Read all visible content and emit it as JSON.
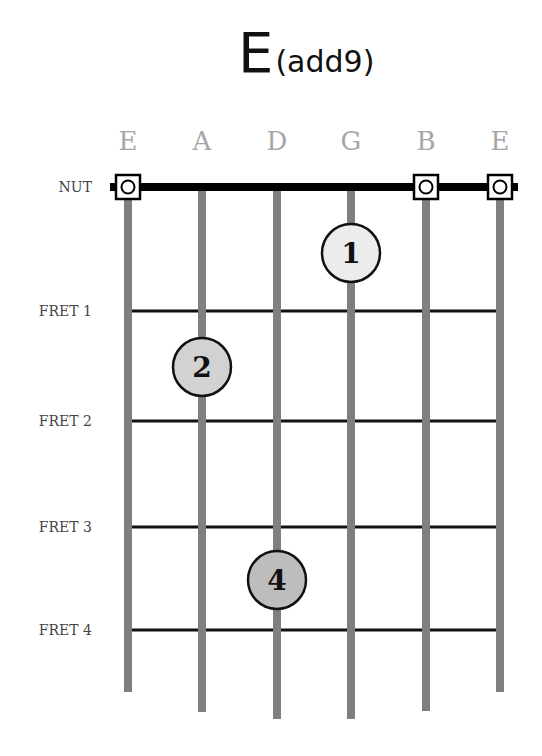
{
  "chord": {
    "name_main": "E",
    "name_suffix": "(add9)"
  },
  "strings": [
    {
      "name": "E",
      "x": 128,
      "bottom": 692
    },
    {
      "name": "A",
      "x": 202,
      "bottom": 712
    },
    {
      "name": "D",
      "x": 277,
      "bottom": 719
    },
    {
      "name": "G",
      "x": 351,
      "bottom": 719
    },
    {
      "name": "B",
      "x": 426,
      "bottom": 711
    },
    {
      "name": "E",
      "x": 500,
      "bottom": 692
    }
  ],
  "nut": {
    "label": "NUT",
    "y": 187
  },
  "frets": [
    {
      "label": "FRET 1",
      "y": 311
    },
    {
      "label": "FRET 2",
      "y": 421
    },
    {
      "label": "FRET 3",
      "y": 527
    },
    {
      "label": "FRET 4",
      "y": 630
    }
  ],
  "open_strings": [
    0,
    4,
    5
  ],
  "fingers": [
    {
      "finger": "1",
      "string": 3,
      "x": 351,
      "y": 253,
      "fill": "#ececec"
    },
    {
      "finger": "2",
      "string": 1,
      "x": 202,
      "y": 367,
      "fill": "#d2d2d2"
    },
    {
      "finger": "4",
      "string": 2,
      "x": 277,
      "y": 580,
      "fill": "#bdbdbd"
    }
  ],
  "colors": {
    "string": "#7f7f7f",
    "fret": "#111111",
    "nut": "#000000",
    "string_name": "#a6a6a6"
  }
}
